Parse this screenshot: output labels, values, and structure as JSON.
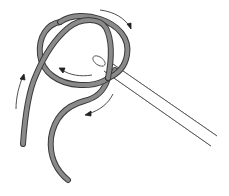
{
  "figure": {
    "colors": {
      "rope_fill": "#8a8a8a",
      "rope_outline": "#3a3a3a",
      "arrow": "#222222",
      "needle_outline": "#555555",
      "background": "#ffffff"
    },
    "arrows": [
      {
        "name": "top-right-arrow",
        "direction": "clockwise"
      },
      {
        "name": "center-arrow",
        "direction": "left"
      },
      {
        "name": "left-tail-arrow",
        "direction": "up"
      },
      {
        "name": "lower-arrow",
        "direction": "down-left"
      }
    ]
  }
}
